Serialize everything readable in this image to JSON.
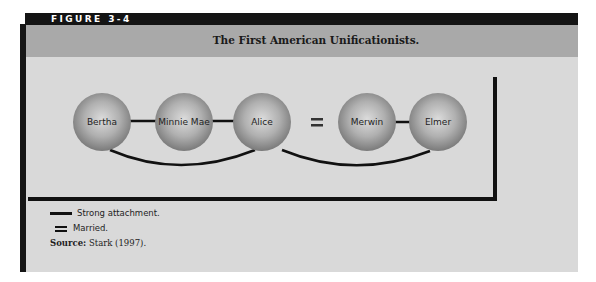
{
  "figure": {
    "label": "FIGURE 3-4",
    "title": "The First American Unificationists."
  },
  "diagram": {
    "nodes": [
      {
        "id": "bertha",
        "label": "Bertha",
        "cx": 102,
        "cy": 123
      },
      {
        "id": "minnie-mae",
        "label": "Minnie Mae",
        "cx": 184,
        "cy": 123
      },
      {
        "id": "alice",
        "label": "Alice",
        "cx": 262,
        "cy": 123
      },
      {
        "id": "merwin",
        "label": "Merwin",
        "cx": 367,
        "cy": 123
      },
      {
        "id": "elmer",
        "label": "Elmer",
        "cx": 438,
        "cy": 123
      }
    ],
    "edges": [
      {
        "from": "Bertha",
        "to": "Minnie Mae",
        "type": "strong attachment",
        "shape": "straight"
      },
      {
        "from": "Minnie Mae",
        "to": "Alice",
        "type": "strong attachment",
        "shape": "straight"
      },
      {
        "from": "Alice",
        "to": "Merwin",
        "type": "married",
        "shape": "double"
      },
      {
        "from": "Merwin",
        "to": "Elmer",
        "type": "strong attachment",
        "shape": "straight"
      },
      {
        "from": "Bertha",
        "to": "Alice",
        "type": "strong attachment",
        "shape": "arc-below"
      },
      {
        "from": "Alice",
        "to": "Elmer",
        "type": "strong attachment",
        "shape": "arc-below"
      }
    ],
    "married_symbol": "="
  },
  "legend": {
    "items": [
      {
        "symbol": "line",
        "label": "Strong attachment."
      },
      {
        "symbol": "double-line",
        "label": "Married."
      }
    ],
    "source_label": "Source:",
    "source_text": "Stark (1997)."
  },
  "colors": {
    "header_bar": "#141414",
    "title_band": "#a9a9a9",
    "body_panel": "#d9d9d9",
    "node_light": "#d6d6d6",
    "node_dark": "#7d7d7d",
    "lines": "#111111"
  }
}
